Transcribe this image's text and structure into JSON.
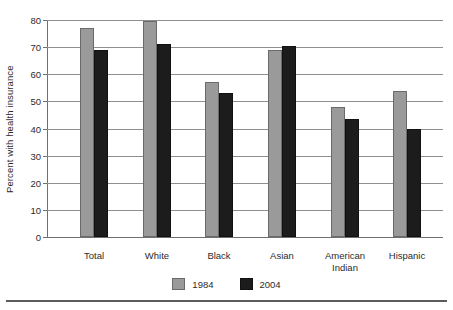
{
  "chart_data": {
    "type": "bar",
    "title": "",
    "xlabel": "",
    "ylabel": "Percent with health insurance",
    "ylim": [
      0,
      80
    ],
    "ytick_step": 10,
    "yticks": [
      "0",
      "10",
      "20",
      "30",
      "40",
      "50",
      "60",
      "70",
      "80"
    ],
    "grid": true,
    "legend_position": "bottom",
    "categories": [
      "Total",
      "White",
      "Black",
      "Asian",
      "American\nIndian",
      "Hispanic"
    ],
    "series": [
      {
        "name": "1984",
        "color": "#9a9a9a",
        "values": [
          77,
          79.5,
          57,
          69,
          48,
          54
        ]
      },
      {
        "name": "2004",
        "color": "#1c1c1c",
        "values": [
          69,
          71,
          53,
          70.5,
          43.5,
          40
        ]
      }
    ]
  },
  "legend": {
    "items": [
      {
        "label": "1984"
      },
      {
        "label": "2004"
      }
    ]
  }
}
